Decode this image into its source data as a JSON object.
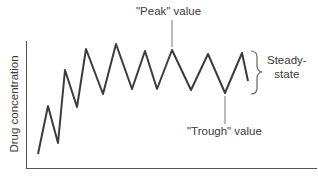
{
  "chart_data": {
    "type": "line",
    "title": "",
    "xlabel": "",
    "ylabel": "Drug concentration",
    "grid": false,
    "legend": null,
    "series": [
      {
        "name": "Drug concentration",
        "points_px": [
          [
            38,
            154
          ],
          [
            48,
            106
          ],
          [
            58,
            143
          ],
          [
            65,
            70
          ],
          [
            77,
            107
          ],
          [
            86,
            49
          ],
          [
            103,
            94
          ],
          [
            116,
            44
          ],
          [
            132,
            89
          ],
          [
            145,
            51
          ],
          [
            157,
            89
          ],
          [
            172,
            50
          ],
          [
            191,
            90
          ],
          [
            208,
            54
          ],
          [
            225,
            93
          ],
          [
            242,
            53
          ],
          [
            248,
            81
          ]
        ]
      }
    ],
    "annotations": [
      {
        "text": "\"Peak\" value",
        "target": "peak at x≈172"
      },
      {
        "text": "\"Trough\" value",
        "target": "trough at x≈225"
      },
      {
        "text": "Steady-state",
        "target": "brace spanning peak-to-trough range"
      }
    ]
  },
  "labels": {
    "ylabel": "Drug concentration",
    "peak": "\"Peak\" value",
    "trough": "\"Trough\" value",
    "steady_line1": "Steady-",
    "steady_line2": "state"
  },
  "colors": {
    "line": "#3c3c3c",
    "axis": "#555555",
    "leader": "#777777",
    "text": "#3a3a3a"
  }
}
